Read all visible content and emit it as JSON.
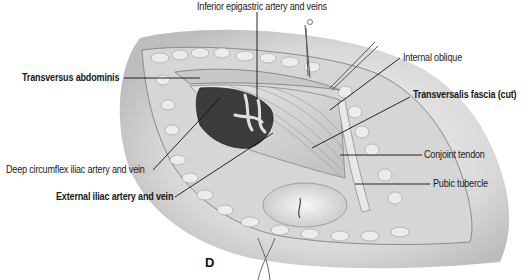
{
  "figure": {
    "panel_letter": "D",
    "labels": {
      "inferior_epigastric": "Inferior epigastric artery and veins",
      "transversus_abdominis": "Transversus abdominis",
      "internal_oblique": "Internal oblique",
      "transversalis_fascia": "Transversalis fascia (cut)",
      "deep_circumflex_iliac": "Deep circumflex iliac artery and vein",
      "conjoint_tendon": "Conjoint tendon",
      "external_iliac": "External iliac artery and vein",
      "pubic_tubercle": "Pubic tubercle"
    },
    "colors": {
      "background": "#ffffff",
      "skin_shadow": "#c9c9c9",
      "fat": "#e4e4e4",
      "muscle": "#d2d2d2",
      "fascia": "#f0f0f0",
      "vessels": "#3a3a3a",
      "text": "#1a1a1a"
    }
  }
}
